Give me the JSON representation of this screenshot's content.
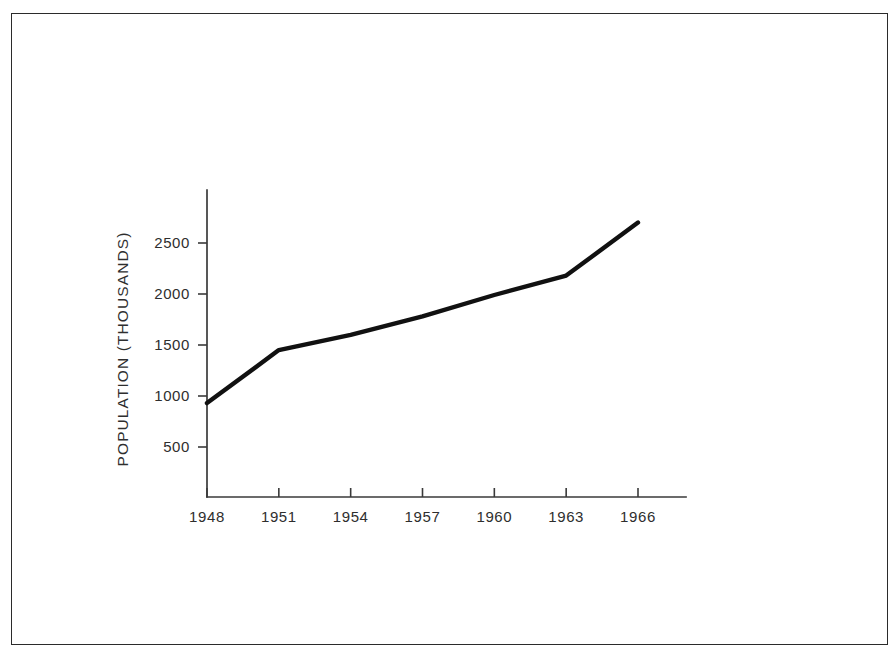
{
  "figure": {
    "frame": {
      "border_color": "#2b2b2b",
      "background": "#ffffff"
    }
  },
  "chart_data": {
    "type": "line",
    "title": "",
    "subtitle": "",
    "xlabel": "",
    "ylabel": "POPULATION (THOUSANDS)",
    "x": [
      1948,
      1951,
      1954,
      1957,
      1960,
      1963,
      1966
    ],
    "values": [
      930,
      1450,
      1600,
      1780,
      1990,
      2180,
      2700
    ],
    "series": [
      {
        "name": "Population",
        "values": [
          930,
          1450,
          1600,
          1780,
          1990,
          2180,
          2700
        ],
        "color": "#111111"
      }
    ],
    "x_tick_labels": [
      "1948",
      "1951",
      "1954",
      "1957",
      "1960",
      "1963",
      "1966"
    ],
    "y_tick_labels": [
      "500",
      "1000",
      "1500",
      "2000",
      "2500"
    ],
    "y_ticks": [
      500,
      1000,
      1500,
      2000,
      2500
    ],
    "xlim": [
      1948,
      1966
    ],
    "ylim": [
      0,
      2900
    ],
    "grid": false,
    "legend": "none",
    "line_color": "#111111",
    "axis_color": "#3a3a3a"
  }
}
